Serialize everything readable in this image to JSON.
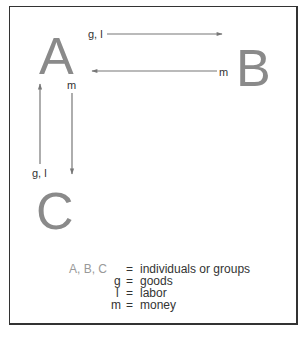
{
  "nodes": {
    "a": "A",
    "b": "B",
    "c": "C"
  },
  "arrows": {
    "a_to_b": "g, l",
    "b_to_a": "m",
    "a_to_c": "m",
    "c_to_a": "g, l"
  },
  "legend": [
    {
      "key": "A, B, C",
      "eq": "=",
      "def": "individuals or groups"
    },
    {
      "key": "g",
      "eq": "=",
      "def": "goods"
    },
    {
      "key": "l",
      "eq": "=",
      "def": "labor"
    },
    {
      "key": "m",
      "eq": "=",
      "def": "money"
    }
  ],
  "colors": {
    "node": "#8a8a8a",
    "arrow": "#777777",
    "text": "#333333"
  }
}
